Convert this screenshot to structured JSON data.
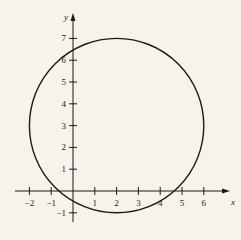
{
  "chart_data": {
    "type": "line",
    "title": "",
    "xlabel": "x",
    "ylabel": "y",
    "x_ticks": [
      "-2",
      "-1",
      "1",
      "2",
      "3",
      "4",
      "5",
      "6"
    ],
    "y_ticks": [
      "-1",
      "1",
      "2",
      "3",
      "4",
      "5",
      "6",
      "7"
    ],
    "xlim": [
      -2.5,
      7
    ],
    "ylim": [
      -1.7,
      7.6
    ],
    "grid": false,
    "series": [
      {
        "name": "circle",
        "shape": "circle",
        "center": [
          2,
          3
        ],
        "radius": 4
      }
    ]
  },
  "axes": {
    "x_label": "x",
    "y_label": "y"
  },
  "colors": {
    "background": "#f6f3ea",
    "stroke": "#1a1a1a"
  }
}
